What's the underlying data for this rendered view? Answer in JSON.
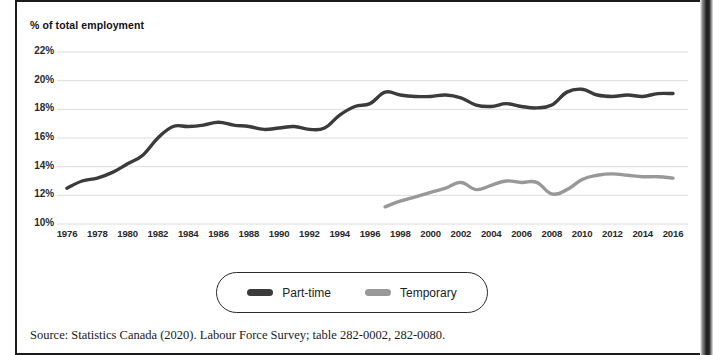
{
  "figure": {
    "axis_title": "% of total employment",
    "source_note": "Source: Statistics Canada (2020). Labour Force Survey; table 282-0002, 282-0080."
  },
  "legend": {
    "items": [
      {
        "label": "Part-time",
        "color": "#3b3b3b"
      },
      {
        "label": "Temporary",
        "color": "#989898"
      }
    ]
  },
  "chart_data": {
    "type": "line",
    "title": "",
    "subtitle": "",
    "xlabel": "",
    "ylabel": "% of total employment",
    "xlim": [
      1975,
      2017
    ],
    "ylim": [
      10,
      22.6
    ],
    "grid": "horizontal",
    "legend_position": "bottom",
    "ytick_labels": [
      "22%",
      "20%",
      "18%",
      "16%",
      "14%",
      "12%",
      "10%"
    ],
    "ytick_values": [
      22,
      20,
      18,
      16,
      14,
      12,
      10
    ],
    "xtick_labels": [
      "1976",
      "1978",
      "1980",
      "1982",
      "1984",
      "1986",
      "1988",
      "1990",
      "1992",
      "1994",
      "1996",
      "1998",
      "2000",
      "2002",
      "2004",
      "2006",
      "2008",
      "2010",
      "2012",
      "2014",
      "2016"
    ],
    "xtick_values": [
      1976,
      1978,
      1980,
      1982,
      1984,
      1986,
      1988,
      1990,
      1992,
      1994,
      1996,
      1998,
      2000,
      2002,
      2004,
      2006,
      2008,
      2010,
      2012,
      2014,
      2016
    ],
    "series": [
      {
        "name": "Part-time",
        "color": "#3b3b3b",
        "x": [
          1976,
          1977,
          1978,
          1979,
          1980,
          1981,
          1982,
          1983,
          1984,
          1985,
          1986,
          1987,
          1988,
          1989,
          1990,
          1991,
          1992,
          1993,
          1994,
          1995,
          1996,
          1997,
          1998,
          1999,
          2000,
          2001,
          2002,
          2003,
          2004,
          2005,
          2006,
          2007,
          2008,
          2009,
          2010,
          2011,
          2012,
          2013,
          2014,
          2015,
          2016
        ],
        "values": [
          12.5,
          13.0,
          13.2,
          13.6,
          14.2,
          14.8,
          16.0,
          16.8,
          16.8,
          16.9,
          17.1,
          16.9,
          16.8,
          16.6,
          16.7,
          16.8,
          16.6,
          16.7,
          17.6,
          18.2,
          18.4,
          19.2,
          19.0,
          18.9,
          18.9,
          19.0,
          18.8,
          18.3,
          18.2,
          18.4,
          18.2,
          18.1,
          18.3,
          19.2,
          19.4,
          19.0,
          18.9,
          19.0,
          18.9,
          19.1,
          19.1
        ]
      },
      {
        "name": "Temporary",
        "color": "#989898",
        "x": [
          1997,
          1998,
          1999,
          2000,
          2001,
          2002,
          2003,
          2004,
          2005,
          2006,
          2007,
          2008,
          2009,
          2010,
          2011,
          2012,
          2013,
          2014,
          2015,
          2016
        ],
        "values": [
          11.2,
          11.6,
          11.9,
          12.2,
          12.5,
          12.9,
          12.4,
          12.7,
          13.0,
          12.9,
          12.9,
          12.1,
          12.4,
          13.1,
          13.4,
          13.5,
          13.4,
          13.3,
          13.3,
          13.2
        ]
      }
    ]
  }
}
